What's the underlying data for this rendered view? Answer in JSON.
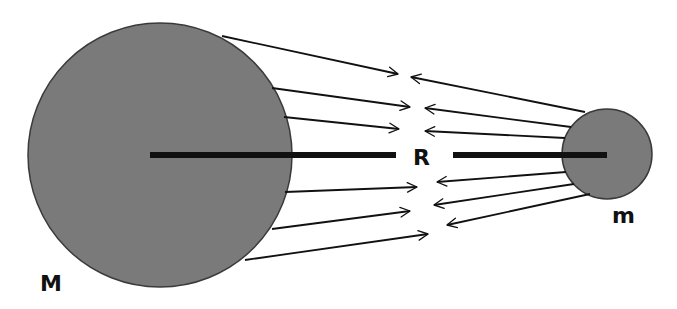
{
  "diagram": {
    "title": "",
    "colors": {
      "body_fill": "#7a7a7a",
      "body_stroke": "#3a3a3a",
      "line": "#111111",
      "background": "#ffffff"
    },
    "large_body": {
      "label": "M",
      "cx": 160,
      "cy": 155,
      "r": 132
    },
    "small_body": {
      "label": "m",
      "cx": 607,
      "cy": 154,
      "r": 45
    },
    "distance": {
      "label": "R"
    },
    "arrows_from_M": [
      {
        "x1": 222,
        "y1": 36,
        "x2": 398,
        "y2": 74
      },
      {
        "x1": 272,
        "y1": 88,
        "x2": 410,
        "y2": 107
      },
      {
        "x1": 284,
        "y1": 117,
        "x2": 399,
        "y2": 129
      },
      {
        "x1": 285,
        "y1": 192,
        "x2": 417,
        "y2": 187
      },
      {
        "x1": 272,
        "y1": 229,
        "x2": 410,
        "y2": 211
      },
      {
        "x1": 245,
        "y1": 260,
        "x2": 428,
        "y2": 234
      }
    ],
    "arrows_from_m": [
      {
        "x1": 585,
        "y1": 112,
        "x2": 411,
        "y2": 77
      },
      {
        "x1": 571,
        "y1": 127,
        "x2": 425,
        "y2": 108
      },
      {
        "x1": 565,
        "y1": 138,
        "x2": 425,
        "y2": 131
      },
      {
        "x1": 566,
        "y1": 172,
        "x2": 437,
        "y2": 182
      },
      {
        "x1": 574,
        "y1": 184,
        "x2": 434,
        "y2": 205
      },
      {
        "x1": 590,
        "y1": 194,
        "x2": 447,
        "y2": 225
      }
    ]
  }
}
